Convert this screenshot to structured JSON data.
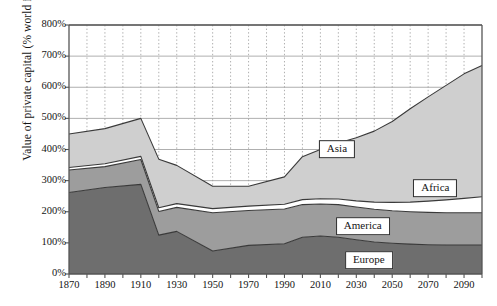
{
  "chart_data": {
    "type": "area",
    "title": "",
    "xlabel": "",
    "ylabel": "Value of private capital (% world income)",
    "xlim": [
      1870,
      2100
    ],
    "ylim": [
      0,
      800
    ],
    "grid": true,
    "stacked": true,
    "legend_position": "inline-labels",
    "ytick_labels": [
      "800%",
      "700%",
      "600%",
      "500%",
      "400%",
      "300%",
      "200%",
      "100%",
      "0%"
    ],
    "ytick_values": [
      800,
      700,
      600,
      500,
      400,
      300,
      200,
      100,
      0
    ],
    "xtick_labels": [
      "1870",
      "1890",
      "1910",
      "1930",
      "1950",
      "1970",
      "1990",
      "2010",
      "2030",
      "2050",
      "2070",
      "2090"
    ],
    "xtick_values": [
      1870,
      1890,
      1910,
      1930,
      1950,
      1970,
      1990,
      2010,
      2030,
      2050,
      2070,
      2090
    ],
    "x": [
      1870,
      1890,
      1910,
      1920,
      1930,
      1950,
      1970,
      1990,
      2000,
      2010,
      2020,
      2030,
      2040,
      2050,
      2060,
      2070,
      2080,
      2090,
      2100
    ],
    "series": [
      {
        "name": "Europe",
        "color": "#6e6e6e",
        "values": [
          262,
          278,
          288,
          125,
          137,
          74,
          92,
          97,
          118,
          122,
          118,
          110,
          103,
          99,
          96,
          94,
          93,
          93,
          93
        ]
      },
      {
        "name": "America",
        "color": "#9d9d9d",
        "values": [
          72,
          67,
          80,
          76,
          77,
          123,
          112,
          112,
          105,
          103,
          105,
          105,
          105,
          104,
          104,
          104,
          104,
          104,
          104
        ]
      },
      {
        "name": "Africa",
        "color": "#ffffff",
        "values": [
          8,
          9,
          10,
          12,
          12,
          13,
          14,
          15,
          16,
          17,
          18,
          20,
          23,
          27,
          31,
          36,
          41,
          46,
          51
        ]
      },
      {
        "name": "Asia",
        "color": "#cfcfcf",
        "values": [
          108,
          113,
          122,
          156,
          123,
          72,
          64,
          88,
          138,
          158,
          180,
          203,
          228,
          260,
          300,
          335,
          368,
          400,
          422
        ]
      }
    ],
    "totals": [
      450,
      467,
      500,
      369,
      349,
      282,
      282,
      312,
      377,
      400,
      421,
      438,
      459,
      490,
      531,
      569,
      606,
      643,
      670
    ],
    "inline_labels": [
      {
        "text": "Asia",
        "x_frac": 0.678,
        "y_frac": 0.487
      },
      {
        "text": "Africa",
        "x_frac": 0.876,
        "y_frac": 0.614
      },
      {
        "text": "America",
        "x_frac": 0.73,
        "y_frac": 0.74
      },
      {
        "text": "Europe",
        "x_frac": 0.742,
        "y_frac": 0.85
      }
    ],
    "colors": {
      "europe": "#6e6e6e",
      "america": "#9d9d9d",
      "africa": "#ffffff",
      "asia": "#cfcfcf",
      "axis": "#555555",
      "gridline": "#9a9a9a",
      "outline": "#3a3a3a",
      "background": "#ffffff"
    }
  }
}
